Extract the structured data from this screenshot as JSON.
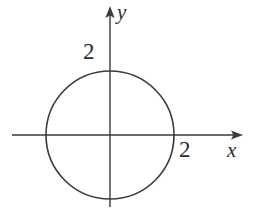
{
  "figure": {
    "background_color": "#ffffff",
    "stroke_color": "#3a3a3a",
    "text_color": "#2e2e2e",
    "width": 256,
    "height": 209
  },
  "axes": {
    "x_axis_label": "x",
    "y_axis_label": "y",
    "x_tick_label": "2",
    "y_tick_label": "2",
    "origin": {
      "x": 110,
      "y": 135
    },
    "x_axis_line": {
      "x1": 12,
      "y1": 135,
      "x2": 240,
      "y2": 135
    },
    "y_axis_line": {
      "x1": 110,
      "y1": 9,
      "x2": 110,
      "y2": 207
    },
    "x_arrow_tip": {
      "x": 243,
      "y": 135
    },
    "y_arrow_tip": {
      "x": 110,
      "y": 6
    }
  },
  "chart_data": {
    "type": "line",
    "title": "",
    "subtitle": "",
    "xlabel": "x",
    "ylabel": "y",
    "grid": false,
    "legend": "none",
    "annotations": [
      {
        "text": "2",
        "axis": "y",
        "value": 2,
        "position": "above-left-of-y-intercept"
      },
      {
        "text": "2",
        "axis": "x",
        "value": 2,
        "position": "below-right-of-x-intercept"
      }
    ],
    "curves": [
      {
        "name": "circle",
        "equation": "x^2 + y^2 = 4",
        "shape": "circle",
        "center": [
          0,
          0
        ],
        "radius": 2,
        "x_intercepts": [
          -2,
          2
        ],
        "y_intercepts": [
          -2,
          2
        ],
        "stroke": "#3a3a3a"
      }
    ],
    "xlim": [
      -3.05,
      4.15
    ],
    "ylim": [
      -2.25,
      4.0
    ],
    "xticks": [
      2
    ],
    "yticks": [
      2
    ],
    "pixel_geometry": {
      "center_px": [
        110,
        135
      ],
      "radius_px": 64,
      "units_per_pixel": 0.03125
    }
  }
}
